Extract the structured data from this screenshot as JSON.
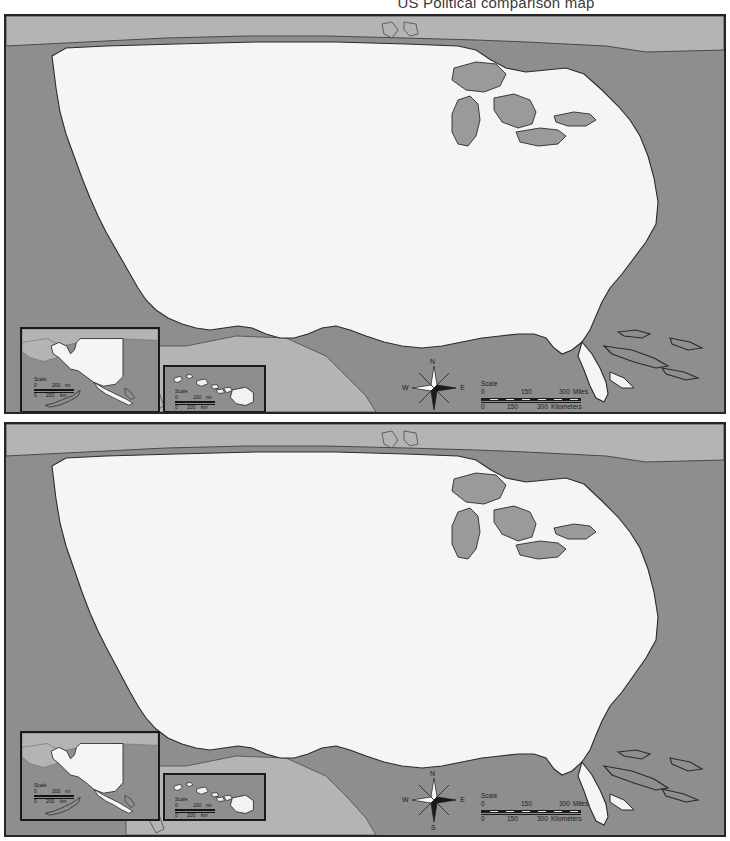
{
  "document": {
    "title": "US Political comparison map"
  },
  "maps": [
    {
      "id": "map-top",
      "name": "upper-us-political-map",
      "compass": {
        "north": "N",
        "east": "E",
        "south": "S",
        "west": "W"
      },
      "scale": {
        "label": "Scale",
        "miles": {
          "ticks": [
            "0",
            "150",
            "300"
          ],
          "unit": "Miles"
        },
        "kilometers": {
          "ticks": [
            "0",
            "150",
            "300"
          ],
          "unit": "Kilometers"
        }
      },
      "insets": [
        {
          "name": "alaska-inset",
          "scale": {
            "label": "Scale",
            "miles": {
              "ticks": [
                "0",
                "200"
              ],
              "unit": "mi"
            },
            "kilometers": {
              "ticks": [
                "0",
                "200"
              ],
              "unit": "km"
            }
          }
        },
        {
          "name": "hawaii-inset",
          "scale": {
            "label": "Scale",
            "miles": {
              "ticks": [
                "0",
                "100"
              ],
              "unit": "mi"
            },
            "kilometers": {
              "ticks": [
                "0",
                "100"
              ],
              "unit": "km"
            }
          }
        }
      ]
    },
    {
      "id": "map-bottom",
      "name": "lower-us-political-map",
      "compass": {
        "north": "N",
        "east": "E",
        "south": "S",
        "west": "W"
      },
      "scale": {
        "label": "Scale",
        "miles": {
          "ticks": [
            "0",
            "150",
            "300"
          ],
          "unit": "Miles"
        },
        "kilometers": {
          "ticks": [
            "0",
            "150",
            "300"
          ],
          "unit": "Kilometers"
        }
      },
      "insets": [
        {
          "name": "alaska-inset",
          "scale": {
            "label": "Scale",
            "miles": {
              "ticks": [
                "0",
                "200"
              ],
              "unit": "mi"
            },
            "kilometers": {
              "ticks": [
                "0",
                "200"
              ],
              "unit": "km"
            }
          }
        },
        {
          "name": "hawaii-inset",
          "scale": {
            "label": "Scale",
            "miles": {
              "ticks": [
                "0",
                "100"
              ],
              "unit": "mi"
            },
            "kilometers": {
              "ticks": [
                "0",
                "100"
              ],
              "unit": "km"
            }
          }
        }
      ]
    }
  ],
  "colors": {
    "ocean": "#8e8e8e",
    "land_us": "#f5f5f5",
    "land_neighbor": "#b4b4b4",
    "lake": "#9a9a9a",
    "outline": "#2b2b2b",
    "frame": "#262626",
    "page_background": "#ffffff",
    "title_text": "#3a3a3a"
  }
}
